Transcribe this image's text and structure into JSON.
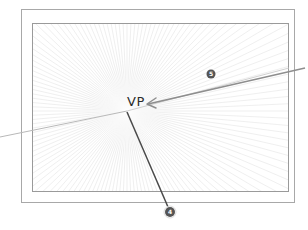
{
  "diagram": {
    "title": "",
    "vanishing_point": {
      "label": "VP",
      "x": 127,
      "y": 111
    },
    "annotations": [
      {
        "number": "5",
        "x": 211,
        "y": 74
      },
      {
        "number": "4",
        "x": 170,
        "y": 212
      }
    ],
    "colors": {
      "frame": "#9a9a9a",
      "rays": "#e2e2e2",
      "horizon": "#b5b5b5",
      "arrow": "#8c8c8c",
      "pointer": "#4a4a4a",
      "badge": "#555555"
    }
  }
}
